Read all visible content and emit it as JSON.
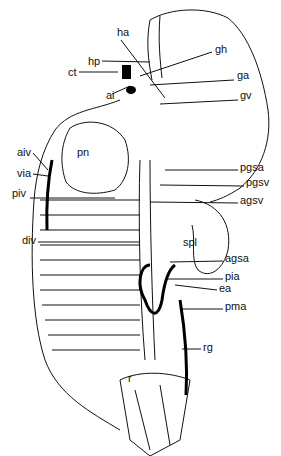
{
  "figure": {
    "type": "anatomical line drawing",
    "colors": {
      "ink": "#111111",
      "background": "#ffffff"
    },
    "labels": [
      {
        "id": "ha",
        "text": "ha",
        "x": 117,
        "y": 32
      },
      {
        "id": "hp",
        "text": "hp",
        "x": 88,
        "y": 62
      },
      {
        "id": "ct",
        "text": "ct",
        "x": 68,
        "y": 73
      },
      {
        "id": "ai",
        "text": "ai",
        "x": 106,
        "y": 96
      },
      {
        "id": "gh",
        "text": "gh",
        "x": 215,
        "y": 50
      },
      {
        "id": "ga",
        "text": "ga",
        "x": 237,
        "y": 76
      },
      {
        "id": "gv",
        "text": "gv",
        "x": 240,
        "y": 95
      },
      {
        "id": "aiv",
        "text": "aiv",
        "x": 17,
        "y": 152
      },
      {
        "id": "pn",
        "text": "pn",
        "x": 77,
        "y": 153
      },
      {
        "id": "via",
        "text": "via",
        "x": 17,
        "y": 174
      },
      {
        "id": "piv",
        "text": "piv",
        "x": 12,
        "y": 194
      },
      {
        "id": "pgsa",
        "text": "pgsa",
        "x": 240,
        "y": 167
      },
      {
        "id": "pgsv",
        "text": "pgsv",
        "x": 246,
        "y": 183
      },
      {
        "id": "agsv",
        "text": "agsv",
        "x": 240,
        "y": 200
      },
      {
        "id": "div",
        "text": "div",
        "x": 22,
        "y": 240
      },
      {
        "id": "spl",
        "text": "spl",
        "x": 183,
        "y": 241
      },
      {
        "id": "agsa",
        "text": "agsa",
        "x": 225,
        "y": 258
      },
      {
        "id": "pia",
        "text": "pia",
        "x": 225,
        "y": 276
      },
      {
        "id": "ea",
        "text": "ea",
        "x": 219,
        "y": 287
      },
      {
        "id": "pma",
        "text": "pma",
        "x": 225,
        "y": 306
      },
      {
        "id": "rg",
        "text": "rg",
        "x": 203,
        "y": 347
      },
      {
        "id": "r",
        "text": "r",
        "x": 128,
        "y": 378
      }
    ]
  }
}
